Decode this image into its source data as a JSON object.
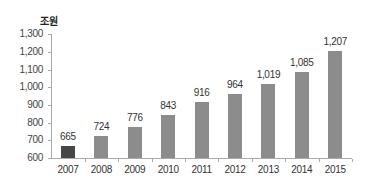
{
  "chart_data": {
    "type": "bar",
    "title": "",
    "unit_label": "조원",
    "xlabel": "",
    "ylabel": "조원",
    "ylim": [
      600,
      1300
    ],
    "yticks": [
      600,
      700,
      800,
      900,
      1000,
      1100,
      1200,
      1300
    ],
    "ytick_labels": [
      "600",
      "700",
      "800",
      "900",
      "1,000",
      "1,100",
      "1,200",
      "1,300"
    ],
    "categories": [
      "2007",
      "2008",
      "2009",
      "2010",
      "2011",
      "2012",
      "2013",
      "2014",
      "2015"
    ],
    "values": [
      665,
      724,
      776,
      843,
      916,
      964,
      1019,
      1085,
      1207
    ],
    "value_labels": [
      "665",
      "724",
      "776",
      "843",
      "916",
      "964",
      "1,019",
      "1,085",
      "1,207"
    ],
    "grid": false,
    "legend": null,
    "colors": {
      "highlight": "#474747",
      "default": "#8c8c8c"
    },
    "highlight_index": 0
  }
}
